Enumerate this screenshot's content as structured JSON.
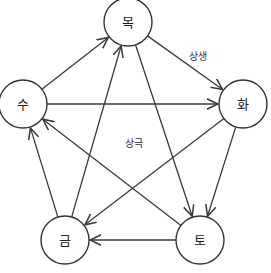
{
  "diagram": {
    "nodes": [
      {
        "id": "wood",
        "label": "목",
        "x": 128,
        "y": 22
      },
      {
        "id": "fire",
        "label": "화",
        "x": 243,
        "y": 104
      },
      {
        "id": "earth",
        "label": "토",
        "x": 200,
        "y": 240
      },
      {
        "id": "metal",
        "label": "금",
        "x": 65,
        "y": 240
      },
      {
        "id": "water",
        "label": "수",
        "x": 23,
        "y": 104
      }
    ],
    "node_radius": 24,
    "edges_generating": [
      {
        "from": "wood",
        "to": "fire"
      },
      {
        "from": "fire",
        "to": "earth"
      },
      {
        "from": "earth",
        "to": "metal"
      },
      {
        "from": "metal",
        "to": "water"
      },
      {
        "from": "water",
        "to": "wood"
      }
    ],
    "edges_overcoming": [
      {
        "from": "wood",
        "to": "earth"
      },
      {
        "from": "fire",
        "to": "metal"
      },
      {
        "from": "earth",
        "to": "water"
      },
      {
        "from": "metal",
        "to": "wood"
      },
      {
        "from": "water",
        "to": "fire"
      }
    ],
    "labels": {
      "generating": "상생",
      "overcoming": "상극"
    },
    "colors": {
      "stroke": "#333333",
      "background": "#ffffff"
    }
  }
}
